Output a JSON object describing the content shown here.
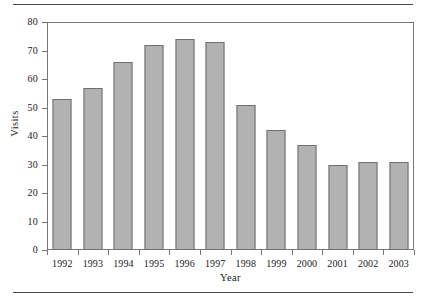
{
  "figure": {
    "background_color": "#ffffff",
    "rule_color": "#4a4a4a",
    "frame_color": "#777777"
  },
  "chart_data": {
    "type": "bar",
    "title": "",
    "subtitle": "",
    "xlabel": "Year",
    "ylabel": "Visits",
    "categories": [
      "1992",
      "1993",
      "1994",
      "1995",
      "1996",
      "1997",
      "1998",
      "1999",
      "2000",
      "2001",
      "2002",
      "2003"
    ],
    "values": [
      53,
      57,
      66,
      72,
      74,
      73,
      51,
      42,
      37,
      30,
      31,
      31
    ],
    "ylim": [
      0,
      80
    ],
    "ytick_labels": [
      "0",
      "10",
      "20",
      "30",
      "40",
      "50",
      "60",
      "70",
      "80"
    ],
    "ytick_values": [
      0,
      10,
      20,
      30,
      40,
      50,
      60,
      70,
      80
    ],
    "grid": false,
    "legend": false,
    "legend_position": "none",
    "bar_fill_color": "#b2b2b2",
    "bar_edge_color": "#6f6f6f",
    "annotations": []
  }
}
